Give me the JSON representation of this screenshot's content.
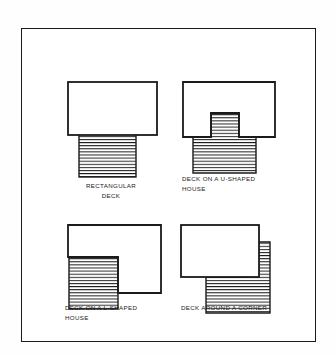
{
  "document": {
    "kind": "line-drawing",
    "title": "Deck configuration diagrams",
    "frame": {
      "x": 21,
      "y": 28,
      "width": 295,
      "height": 314,
      "stroke": "#1a1a1a",
      "stroke_width": 1.6
    },
    "background": "#ffffff",
    "ink_color": "#1a1a1a"
  },
  "figures": [
    {
      "id": "rectangular-deck",
      "caption": "RECTANGULAR\nDECK",
      "caption_align": "center",
      "caption_x": 62,
      "caption_y": 180,
      "caption_width": 96,
      "box": {
        "x": 60,
        "y": 76,
        "width": 102,
        "height": 102
      },
      "house": {
        "x": 8,
        "y": 5,
        "width": 88,
        "height": 53
      },
      "deck": {
        "x": 18,
        "y": 58,
        "width": 57,
        "height": 42
      },
      "hatch_lines": 13,
      "hatch_spacing": 3.1
    },
    {
      "id": "deck-on-a-u-shaped-house",
      "caption": "DECK ON A U-SHAPED\nHOUSE",
      "caption_align": "left",
      "caption_x": 181,
      "caption_y": 172,
      "caption_width": 110,
      "box": {
        "x": 178,
        "y": 76,
        "width": 110,
        "height": 102
      },
      "house_outer": {
        "x": 4,
        "y": 5,
        "width": 92,
        "height": 55
      },
      "notch": {
        "x": 32,
        "y": 36,
        "width": 28,
        "height": 24
      },
      "deck": {
        "x": 14,
        "y": 60,
        "width": 62,
        "height": 36
      },
      "hatch_lines": 12,
      "hatch_spacing": 3.1
    },
    {
      "id": "deck-on-an-l-shaped-house",
      "caption": "DECK ON A L-SHAPED\nHOUSE",
      "caption_align": "left",
      "caption_x": 64,
      "caption_y": 302,
      "caption_width": 112,
      "box": {
        "x": 60,
        "y": 220,
        "width": 112,
        "height": 100
      },
      "house_outer": {
        "x": 7,
        "y": 4,
        "width": 93,
        "height": 68
      },
      "notch": {
        "x": 7,
        "y": 36,
        "width": 48,
        "height": 36
      },
      "deck": {
        "x": 9,
        "y": 36,
        "width": 48,
        "height": 52
      },
      "hatch_lines": 16,
      "hatch_spacing": 3.1
    },
    {
      "id": "deck-around-a-corner",
      "caption": "DECK AROUND A CORNER",
      "caption_align": "left",
      "caption_x": 180,
      "caption_y": 302,
      "caption_width": 116,
      "box": {
        "x": 178,
        "y": 220,
        "width": 112,
        "height": 100
      },
      "house": {
        "x": 2,
        "y": 4,
        "width": 78,
        "height": 52
      },
      "deck_vertical": {
        "x": 66,
        "y": 21,
        "width": 24,
        "height": 35
      },
      "deck_horizontal": {
        "x": 26,
        "y": 56,
        "width": 64,
        "height": 36
      },
      "hatch_lines": 22,
      "hatch_spacing": 3.1
    }
  ]
}
